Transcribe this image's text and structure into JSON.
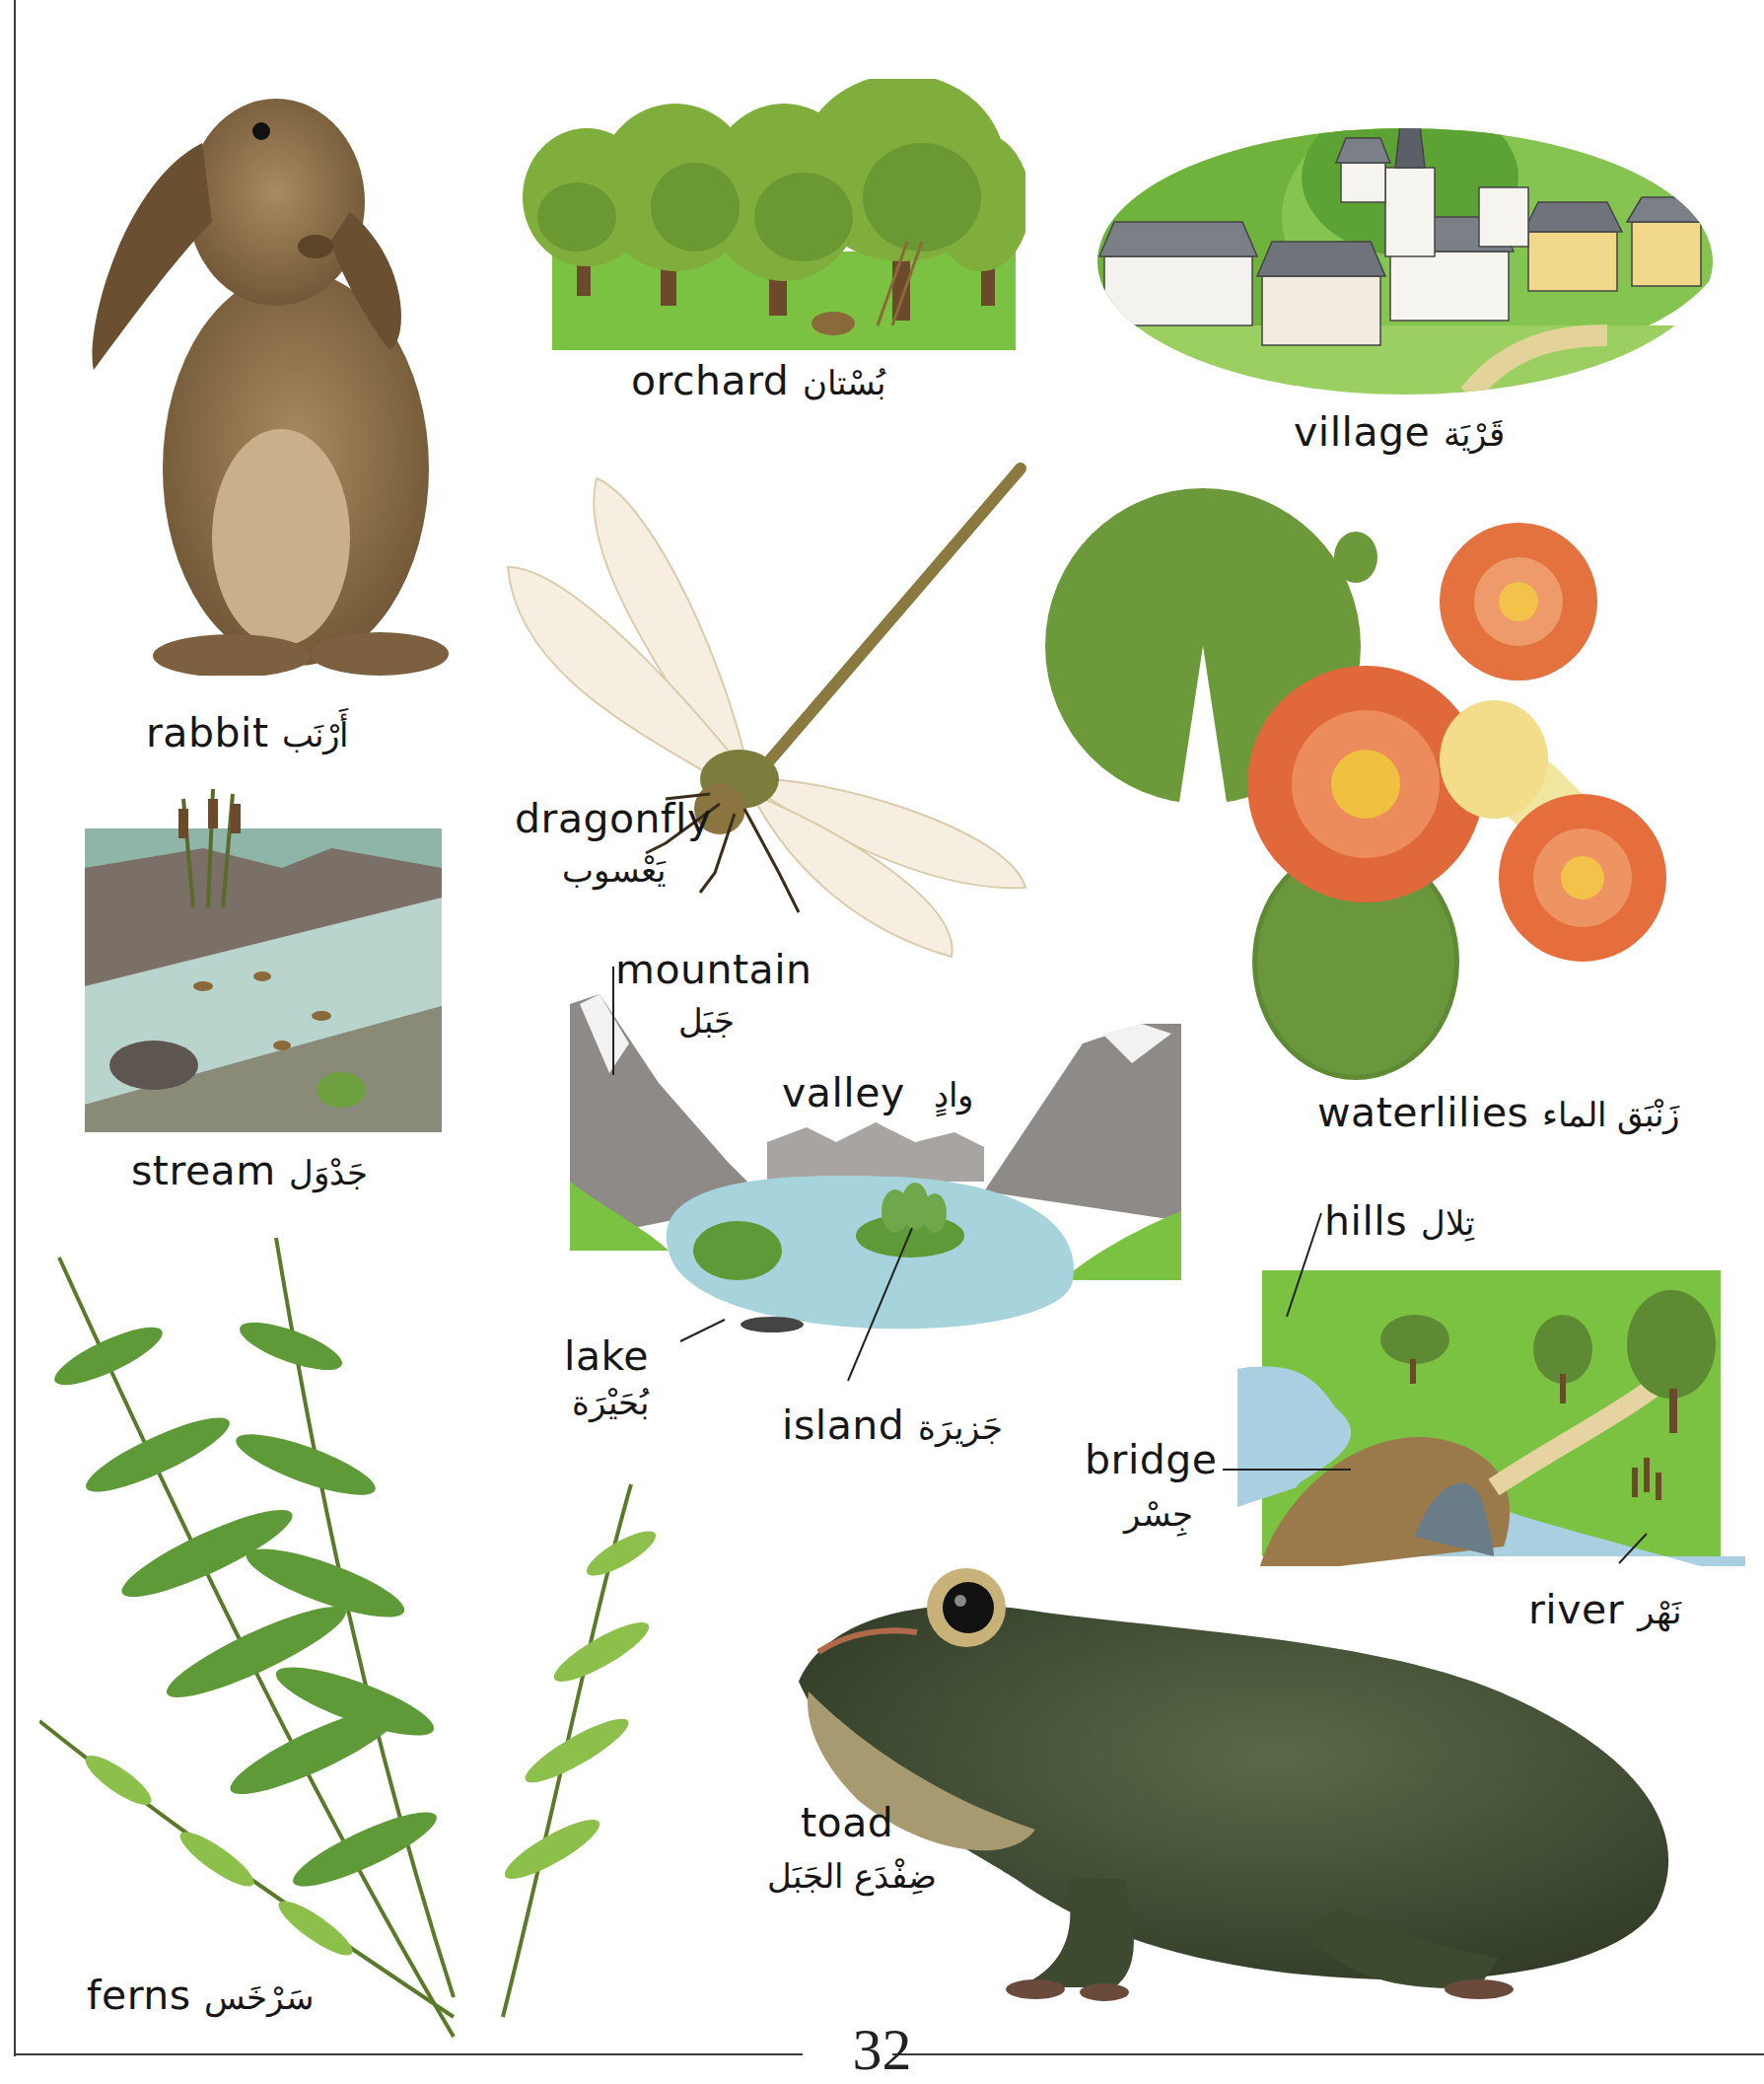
{
  "page": {
    "number": "32"
  },
  "entries": {
    "rabbit": {
      "en": "rabbit",
      "ar": "أَرْنَب"
    },
    "orchard": {
      "en": "orchard",
      "ar": "بُسْتان"
    },
    "village": {
      "en": "village",
      "ar": "قَرْيَة"
    },
    "dragonfly": {
      "en": "dragonfly",
      "ar": "يَعْسوب"
    },
    "waterlilies": {
      "en": "waterlilies",
      "ar": "زَنْبَق الماء"
    },
    "stream": {
      "en": "stream",
      "ar": "جَدْوَل"
    },
    "mountain": {
      "en": "mountain",
      "ar": "جَبَل"
    },
    "valley": {
      "en": "valley",
      "ar": "وادٍ"
    },
    "lake": {
      "en": "lake",
      "ar": "بُحَيْرَة"
    },
    "island": {
      "en": "island",
      "ar": "جَزيرَة"
    },
    "hills": {
      "en": "hills",
      "ar": "تِلال"
    },
    "bridge": {
      "en": "bridge",
      "ar": "جِسْر"
    },
    "river": {
      "en": "river",
      "ar": "نَهْر"
    },
    "toad": {
      "en": "toad",
      "ar": "ضِفْدَع الجَبَل"
    },
    "ferns": {
      "en": "ferns",
      "ar": "سَرْخَس"
    }
  },
  "illustrations": {
    "rabbit": "rabbit-photo",
    "orchard": "orchard-illustration",
    "village": "village-illustration",
    "dragonfly": "dragonfly-photo",
    "waterlilies": "waterlilies-photo",
    "stream": "stream-illustration",
    "lake_scene": "mountain-lake-valley-illustration",
    "river_scene": "hills-bridge-river-illustration",
    "toad": "toad-photo",
    "ferns": "ferns-photo"
  },
  "colors": {
    "text": "#161616",
    "grass": "#7cc242",
    "water": "#9fd0dc",
    "rock": "#8e8a88",
    "fur": "#8c6d45",
    "lily": "#e0683a",
    "lilypad": "#6c9a3a",
    "toad": "#4a5a3c",
    "fern": "#5f9a38"
  }
}
